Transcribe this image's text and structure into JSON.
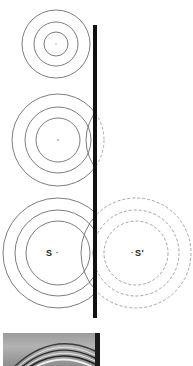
{
  "figure": {
    "colors": {
      "background": "#ffffff",
      "wave_line": "#6e6e6e",
      "dashed_line": "#9a9a9a",
      "barrier": "#111111",
      "label": "#222222"
    },
    "barrier": {
      "x": 95,
      "y_top": 25,
      "y_bottom": 318,
      "width": 4
    },
    "wave_groups": [
      {
        "name": "stage-1",
        "center": [
          56,
          44
        ],
        "radii": [
          12,
          22,
          34
        ]
      },
      {
        "name": "stage-2",
        "center": [
          58,
          140
        ],
        "radii": [
          22,
          33,
          46
        ]
      },
      {
        "name": "stage-3",
        "center": [
          58,
          253
        ],
        "radii": [
          32,
          43,
          55
        ]
      }
    ],
    "image_group": {
      "name": "image-source",
      "center": [
        136,
        253
      ],
      "radii": [
        32,
        43,
        55
      ],
      "dashed": true
    },
    "labels": {
      "source": "S",
      "image_source": "S'"
    }
  },
  "photo": {
    "caption_visible": false,
    "ripple_count": 6
  }
}
